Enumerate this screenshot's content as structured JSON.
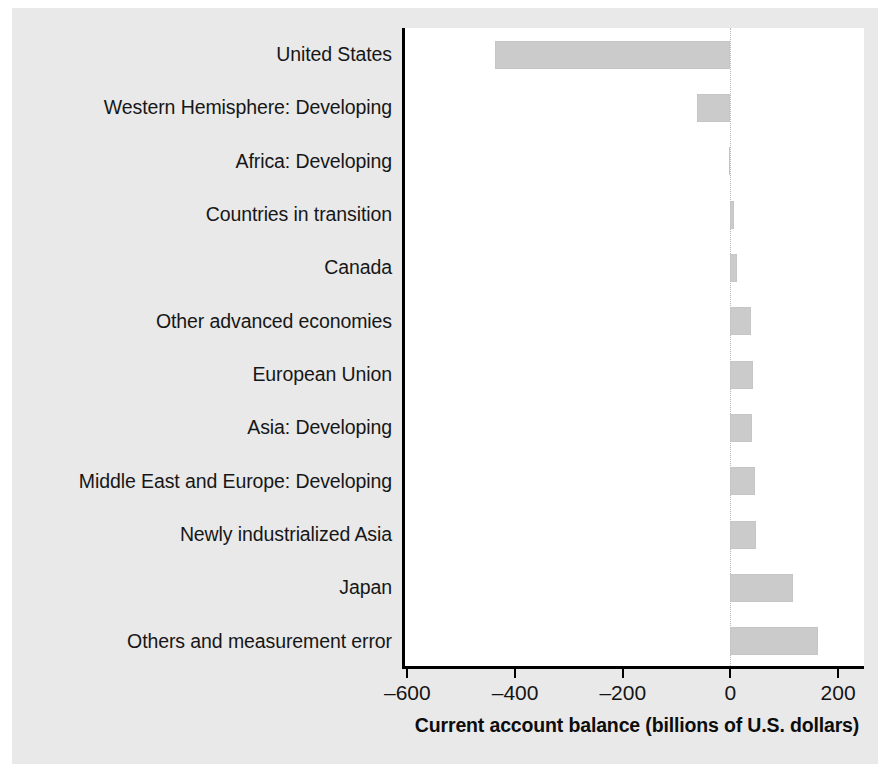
{
  "chart_data": {
    "type": "bar",
    "orientation": "horizontal",
    "title": "",
    "subtitle": "",
    "xlabel": "Current account balance (billions of U.S. dollars)",
    "ylabel": "",
    "categories": [
      "United States",
      "Western Hemisphere: Developing",
      "Africa: Developing",
      "Countries in transition",
      "Canada",
      "Other advanced economies",
      "European Union",
      "Asia: Developing",
      "Middle East and Europe: Developing",
      "Newly industrialized Asia",
      "Japan",
      "Others and measurement error"
    ],
    "values": [
      -437,
      -63,
      -2,
      6,
      13,
      39,
      42,
      40,
      46,
      48,
      116,
      162
    ],
    "xlim": [
      -610,
      248
    ],
    "xticks": [
      -600,
      -400,
      -200,
      0,
      200
    ],
    "xticklabels": [
      "–600",
      "–400",
      "–200",
      "0",
      "200"
    ],
    "grid": false,
    "legend": null,
    "zero_reference_line": true,
    "colors": {
      "bar_fill": "#cbcbcb",
      "axis": "#000000",
      "zero_line": "#b6b6b6",
      "panel_background": "#e9e9e9",
      "plot_background": "#ffffff",
      "text": "#171717"
    }
  }
}
